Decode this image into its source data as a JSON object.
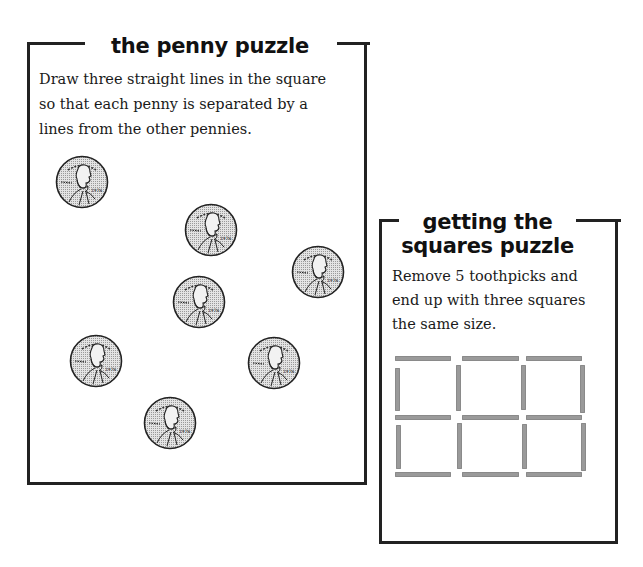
{
  "penny_puzzle": {
    "title": "the penny puzzle",
    "instructions": [
      "Draw three straight lines in the square",
      "so that each penny is separated by a",
      "lines from the other pennies."
    ],
    "pennies": [
      {
        "id": "penny-1",
        "x": 52,
        "y": 137,
        "year": "1976"
      },
      {
        "id": "penny-2",
        "x": 181,
        "y": 185,
        "year": "1976"
      },
      {
        "id": "penny-3",
        "x": 288,
        "y": 227,
        "year": "1976"
      },
      {
        "id": "penny-4",
        "x": 169,
        "y": 257,
        "year": "1976"
      },
      {
        "id": "penny-5",
        "x": 66,
        "y": 316,
        "year": "1976"
      },
      {
        "id": "penny-6",
        "x": 244,
        "y": 318,
        "year": "1976"
      },
      {
        "id": "penny-7",
        "x": 140,
        "y": 378,
        "year": "1976"
      }
    ],
    "penny_motto": "IN GOD WE TRUST",
    "penny_label": "LIBERTY"
  },
  "squares_puzzle": {
    "title_line_1": "getting the",
    "title_line_2": "squares puzzle",
    "instructions": [
      "Remove 5 toothpicks and",
      "end up with three squares",
      "the same size."
    ],
    "toothpick_color": "#9a9a9a",
    "toothpicks": {
      "horizontal": [
        {
          "x": 13,
          "y": 134,
          "w": 56
        },
        {
          "x": 80,
          "y": 134,
          "w": 57
        },
        {
          "x": 144,
          "y": 134,
          "w": 56
        },
        {
          "x": 13,
          "y": 193,
          "w": 56
        },
        {
          "x": 80,
          "y": 193,
          "w": 57
        },
        {
          "x": 144,
          "y": 193,
          "w": 56
        },
        {
          "x": 13,
          "y": 250,
          "w": 56
        },
        {
          "x": 80,
          "y": 250,
          "w": 57
        },
        {
          "x": 144,
          "y": 250,
          "w": 56
        }
      ],
      "vertical": [
        {
          "x": 13,
          "y": 146,
          "h": 43
        },
        {
          "x": 74,
          "y": 143,
          "h": 46
        },
        {
          "x": 139,
          "y": 143,
          "h": 45
        },
        {
          "x": 198,
          "y": 143,
          "h": 48
        },
        {
          "x": 14,
          "y": 203,
          "h": 44
        },
        {
          "x": 75,
          "y": 201,
          "h": 46
        },
        {
          "x": 140,
          "y": 202,
          "h": 45
        },
        {
          "x": 199,
          "y": 201,
          "h": 48
        }
      ]
    }
  },
  "colors": {
    "border": "#222222",
    "text": "#1a1a1a",
    "coin_fill": "#cfcfcf",
    "coin_stroke": "#222222"
  }
}
